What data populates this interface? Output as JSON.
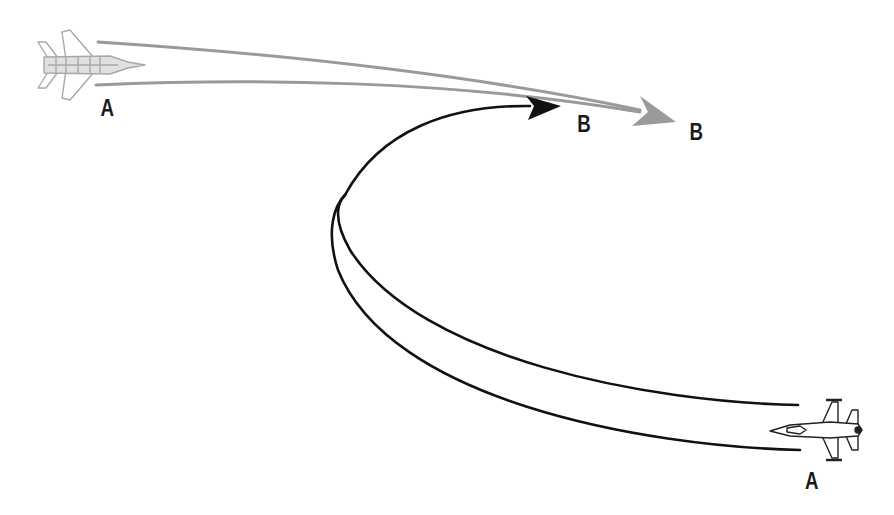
{
  "diagram": {
    "type": "air-combat-maneuver",
    "colors": {
      "gray_path": "#9a9a9a",
      "black_path": "#111111",
      "gray_jet": "#a8a8a8",
      "black_jet": "#222222",
      "label": "#1a1a1a"
    },
    "aircraft": [
      {
        "id": "gray-jet",
        "description": "Twin-engine fighter, gray outline",
        "start_label": "A",
        "end_label": "B"
      },
      {
        "id": "black-jet",
        "description": "Single-engine fighter, black outline, flying left",
        "start_label": "A",
        "end_label": "B"
      }
    ],
    "labels": {
      "gray_start": "A",
      "gray_end": "B",
      "black_start": "A",
      "black_end": "B"
    }
  }
}
